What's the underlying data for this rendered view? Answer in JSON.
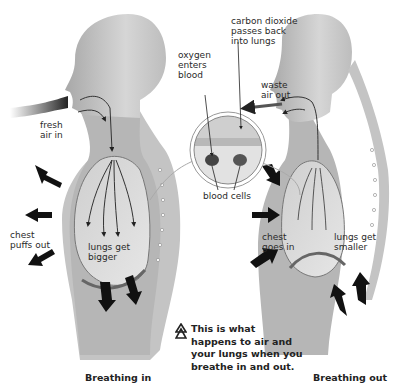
{
  "diagram": {
    "title_note": "This is what\nhappens to air and\nyour lungs when you\nbreathe in and out.",
    "panels": [
      {
        "id": "breathing-in",
        "caption": "Breathing in",
        "labels": {
          "air": "fresh\nair in",
          "chest": "chest\npuffs out",
          "lungs": "lungs get\nbigger"
        }
      },
      {
        "id": "breathing-out",
        "caption": "Breathing out",
        "labels": {
          "air": "waste\nair out",
          "chest": "chest\ngoes in",
          "lungs": "lungs get\nsmaller"
        }
      }
    ],
    "inset": {
      "oxygen": "oxygen\nenters\nblood",
      "carbon_dioxide": "carbon dioxide\npasses back\ninto lungs",
      "blood_cells": "blood cells"
    },
    "colors": {
      "body": "#b9b9b9",
      "body_dark": "#9a9a9a",
      "lung": "#d4d4d4",
      "arrow": "#111111",
      "background": "#ffffff"
    }
  }
}
